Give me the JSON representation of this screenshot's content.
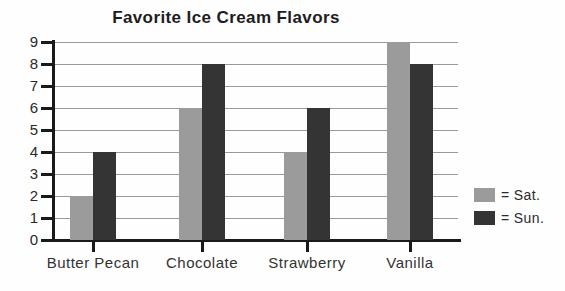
{
  "title": "Favorite Ice Cream Flavors",
  "legend": {
    "items": [
      {
        "label": "= Sat.",
        "color": "#9b9b9b"
      },
      {
        "label": "= Sun.",
        "color": "#343434"
      }
    ]
  },
  "chart_data": {
    "type": "bar",
    "title": "Favorite Ice Cream Flavors",
    "categories": [
      "Butter Pecan",
      "Chocolate",
      "Strawberry",
      "Vanilla"
    ],
    "series": [
      {
        "name": "Sat.",
        "color": "#9b9b9b",
        "values": [
          2,
          6,
          4,
          9
        ]
      },
      {
        "name": "Sun.",
        "color": "#343434",
        "values": [
          4,
          8,
          6,
          8
        ]
      }
    ],
    "xlabel": "",
    "ylabel": "",
    "ylim": [
      0,
      9
    ],
    "yticks": [
      0,
      1,
      2,
      3,
      4,
      5,
      6,
      7,
      8,
      9
    ],
    "grid": true,
    "grid_color": "#9a9a9a",
    "axis_color": "#1a1a1a",
    "text_color": "#2a2a2a",
    "legend_position": "right"
  }
}
